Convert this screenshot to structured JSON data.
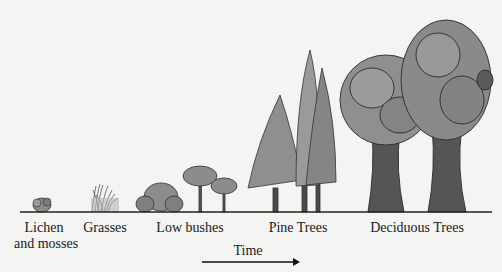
{
  "diagram": {
    "type": "ecological-succession",
    "stages": [
      {
        "label_line1": "Lichen",
        "label_line2": "and mosses"
      },
      {
        "label_line1": "Grasses"
      },
      {
        "label_line1": "Low bushes"
      },
      {
        "label_line1": "Pine Trees"
      },
      {
        "label_line1": "Deciduous Trees"
      }
    ],
    "axis": {
      "label": "Time"
    },
    "colors": {
      "foliage": "#8c8c8c",
      "foliage_dark": "#6e6e6e",
      "trunk": "#4a4a4a",
      "outline": "#2a2a2a",
      "ground": "#222222"
    }
  }
}
